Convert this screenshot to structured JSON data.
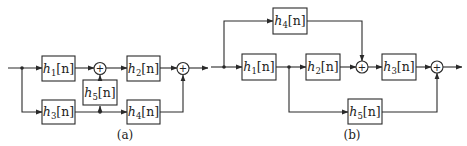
{
  "diagrams": {
    "a": {
      "caption": "(a)",
      "blocks": {
        "h1": {
          "name": "h",
          "sub": "1",
          "arg": "[n]"
        },
        "h2": {
          "name": "h",
          "sub": "2",
          "arg": "[n]"
        },
        "h3": {
          "name": "h",
          "sub": "3",
          "arg": "[n]"
        },
        "h4": {
          "name": "h",
          "sub": "4",
          "arg": "[n]"
        },
        "h5": {
          "name": "h",
          "sub": "5",
          "arg": "[n]"
        }
      },
      "adders": {
        "symbol": "+"
      }
    },
    "b": {
      "caption": "(b)",
      "blocks": {
        "h1": {
          "name": "h",
          "sub": "1",
          "arg": "[n]"
        },
        "h2": {
          "name": "h",
          "sub": "2",
          "arg": "[n]"
        },
        "h3": {
          "name": "h",
          "sub": "3",
          "arg": "[n]"
        },
        "h4": {
          "name": "h",
          "sub": "4",
          "arg": "[n]"
        },
        "h5": {
          "name": "h",
          "sub": "5",
          "arg": "[n]"
        }
      },
      "adders": {
        "symbol": "+"
      }
    }
  },
  "colors": {
    "stroke": "#2a2a2a",
    "background": "#ffffff"
  }
}
